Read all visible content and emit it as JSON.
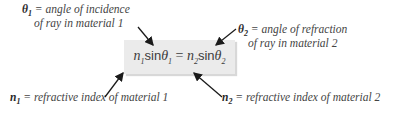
{
  "equation": {
    "n1": "n",
    "n1_sub": "1",
    "sin1": "sin",
    "theta1": "θ",
    "theta1_sub": "1",
    "equals": " = ",
    "n2": "n",
    "n2_sub": "2",
    "sin2": "sin",
    "theta2": "θ",
    "theta2_sub": "2"
  },
  "labels": {
    "theta1": {
      "symbol": "θ",
      "sub": "1",
      "line1": " = angle of incidence",
      "line2": "of ray in material 1"
    },
    "theta2": {
      "symbol": "θ",
      "sub": "2",
      "line1": " = angle of refraction",
      "line2": "of ray in material 2"
    },
    "n1": {
      "symbol": "n",
      "sub": "1",
      "text": " = refractive index of material 1"
    },
    "n2": {
      "symbol": "n",
      "sub": "2",
      "text": " = refractive index of material 2"
    }
  },
  "colors": {
    "box_fill": "#ebebeb",
    "text": "#444444",
    "arrow": "#1a1a1a"
  }
}
